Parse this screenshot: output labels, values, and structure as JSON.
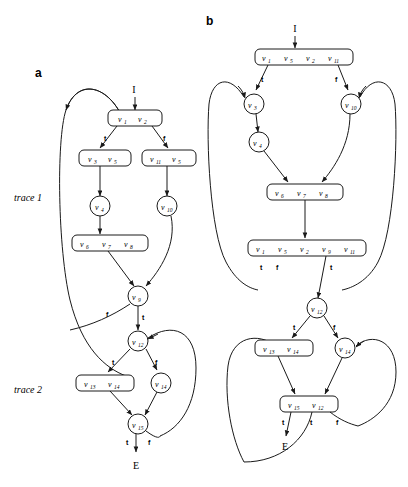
{
  "figure": {
    "panels": [
      {
        "id": "a",
        "label": "a"
      },
      {
        "id": "b",
        "label": "b"
      }
    ],
    "trace_labels": [
      {
        "id": "trace-1",
        "text": "trace 1"
      },
      {
        "id": "trace-2",
        "text": "trace 2"
      }
    ],
    "entry_label": "I",
    "exit_label": "E",
    "branch_true": "t",
    "branch_false": "f",
    "stroke_color": "#1a1a1a",
    "background_color": "#ffffff"
  },
  "panel_a": {
    "label": "a",
    "entry": "I",
    "exit": "E",
    "trace1": "trace 1",
    "trace2": "trace 2",
    "nodes": [
      {
        "id": "a-n1",
        "shape": "box",
        "items": [
          "v1",
          "v2"
        ]
      },
      {
        "id": "a-n2",
        "shape": "box",
        "items": [
          "v3",
          "v5"
        ]
      },
      {
        "id": "a-n3",
        "shape": "box",
        "items": [
          "v11",
          "v5"
        ]
      },
      {
        "id": "a-n4",
        "shape": "circle",
        "items": [
          "v4"
        ]
      },
      {
        "id": "a-n5",
        "shape": "circle",
        "items": [
          "v10"
        ]
      },
      {
        "id": "a-n6",
        "shape": "box",
        "items": [
          "v6",
          "v7",
          "v8"
        ]
      },
      {
        "id": "a-n7",
        "shape": "circle",
        "items": [
          "v9"
        ]
      },
      {
        "id": "a-n8",
        "shape": "circle",
        "items": [
          "v12"
        ]
      },
      {
        "id": "a-n9",
        "shape": "box",
        "items": [
          "v13",
          "v14"
        ]
      },
      {
        "id": "a-n10",
        "shape": "circle",
        "items": [
          "v14"
        ]
      },
      {
        "id": "a-n11",
        "shape": "circle",
        "items": [
          "v15"
        ]
      }
    ],
    "edge_labels": [
      {
        "id": "a-e1",
        "text": "t"
      },
      {
        "id": "a-e2",
        "text": "f"
      },
      {
        "id": "a-e3",
        "text": "f"
      },
      {
        "id": "a-e4",
        "text": "t"
      },
      {
        "id": "a-e5",
        "text": "t"
      },
      {
        "id": "a-e6",
        "text": "f"
      },
      {
        "id": "a-e7",
        "text": "t"
      },
      {
        "id": "a-e8",
        "text": "f"
      }
    ]
  },
  "panel_b": {
    "label": "b",
    "entry": "I",
    "exit": "E",
    "nodes": [
      {
        "id": "b-n1",
        "shape": "box",
        "items": [
          "v1",
          "v5",
          "v2",
          "v11"
        ]
      },
      {
        "id": "b-n2",
        "shape": "circle",
        "items": [
          "v3"
        ]
      },
      {
        "id": "b-n3",
        "shape": "circle",
        "items": [
          "v10"
        ]
      },
      {
        "id": "b-n4",
        "shape": "circle",
        "items": [
          "v4"
        ]
      },
      {
        "id": "b-n5",
        "shape": "box",
        "items": [
          "v6",
          "v7",
          "v8"
        ]
      },
      {
        "id": "b-n6",
        "shape": "box",
        "items": [
          "v1",
          "v5",
          "v2",
          "v9",
          "v11"
        ]
      },
      {
        "id": "b-n7",
        "shape": "circle",
        "items": [
          "v12"
        ]
      },
      {
        "id": "b-n8",
        "shape": "box",
        "items": [
          "v13",
          "v14"
        ]
      },
      {
        "id": "b-n9",
        "shape": "circle",
        "items": [
          "v14"
        ]
      },
      {
        "id": "b-n10",
        "shape": "box",
        "items": [
          "v15",
          "v12"
        ]
      }
    ],
    "edge_labels": [
      {
        "id": "b-e1",
        "text": "t"
      },
      {
        "id": "b-e2",
        "text": "f"
      },
      {
        "id": "b-e3",
        "text": "t"
      },
      {
        "id": "b-e4",
        "text": "f"
      },
      {
        "id": "b-e5",
        "text": "t"
      },
      {
        "id": "b-e6",
        "text": "t"
      },
      {
        "id": "b-e7",
        "text": "f"
      },
      {
        "id": "b-e8",
        "text": "t"
      },
      {
        "id": "b-e9",
        "text": "t"
      },
      {
        "id": "b-e10",
        "text": "f"
      }
    ]
  },
  "vertex_text": {
    "v1": {
      "base": "v",
      "sub": "1"
    },
    "v2": {
      "base": "v",
      "sub": "2"
    },
    "v3": {
      "base": "v",
      "sub": "3"
    },
    "v4": {
      "base": "v",
      "sub": "4"
    },
    "v5": {
      "base": "v",
      "sub": "5"
    },
    "v6": {
      "base": "v",
      "sub": "6"
    },
    "v7": {
      "base": "v",
      "sub": "7"
    },
    "v8": {
      "base": "v",
      "sub": "8"
    },
    "v9": {
      "base": "v",
      "sub": "9"
    },
    "v10": {
      "base": "v",
      "sub": "10"
    },
    "v11": {
      "base": "v",
      "sub": "11"
    },
    "v12": {
      "base": "v",
      "sub": "12"
    },
    "v13": {
      "base": "v",
      "sub": "13"
    },
    "v14": {
      "base": "v",
      "sub": "14"
    },
    "v15": {
      "base": "v",
      "sub": "15"
    }
  }
}
